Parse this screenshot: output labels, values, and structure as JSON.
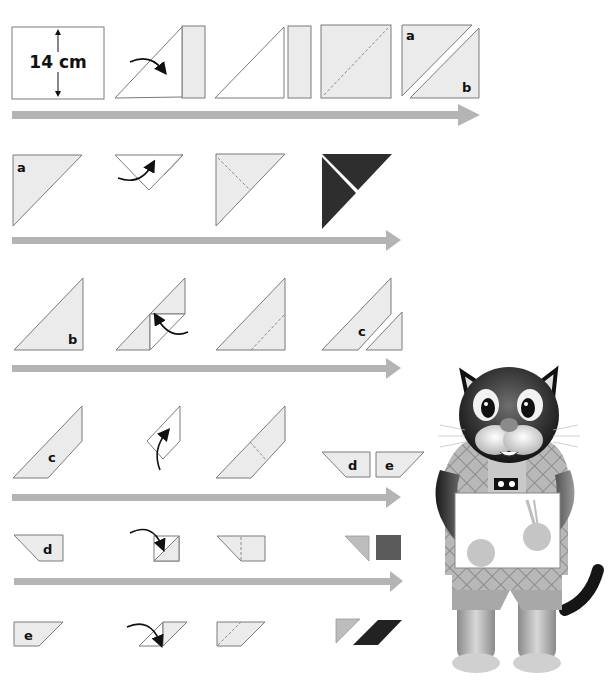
{
  "diagram": {
    "type": "origami-tangram-folding-instructions",
    "colors": {
      "paper": "#ebebeb",
      "outline": "#7a7a7a",
      "progress_arrow": "#b4b4b4",
      "dark_piece": "#2e2e2e",
      "medium_piece": "#5a5a5a",
      "light_piece": "#bdbdbd"
    },
    "rows": [
      {
        "id": "row-1",
        "steps": [
          "square sheet 14 cm",
          "fold diagonal",
          "cut off strip",
          "crease diagonal",
          "cut into triangles a and b"
        ],
        "labels": {
          "size": "14 cm",
          "piece_a": "a",
          "piece_b": "b"
        }
      },
      {
        "id": "row-2",
        "steps": [
          "triangle a",
          "fold tip to base",
          "crease line",
          "two dark triangles"
        ],
        "labels": {
          "piece_a": "a"
        }
      },
      {
        "id": "row-3",
        "steps": [
          "triangle b",
          "fold corner",
          "crease line",
          "cut into c and small triangle"
        ],
        "labels": {
          "piece_b": "b",
          "piece_c": "c"
        }
      },
      {
        "id": "row-4",
        "steps": [
          "parallelogram strip c",
          "fold up",
          "crease line",
          "cut into d and e"
        ],
        "labels": {
          "piece_c": "c",
          "piece_d": "d",
          "piece_e": "e"
        }
      },
      {
        "id": "row-5",
        "steps": [
          "trapezoid d",
          "fold corner",
          "crease line",
          "small triangle and square"
        ],
        "labels": {
          "piece_d": "d"
        }
      },
      {
        "id": "row-6",
        "steps": [
          "trapezoid e",
          "fold corner",
          "crease line",
          "small triangle and parallelogram"
        ],
        "labels": {
          "piece_e": "e"
        }
      }
    ],
    "mascot": {
      "name": "cat mascot holding blank sign",
      "icon": "cat-illustration"
    }
  }
}
